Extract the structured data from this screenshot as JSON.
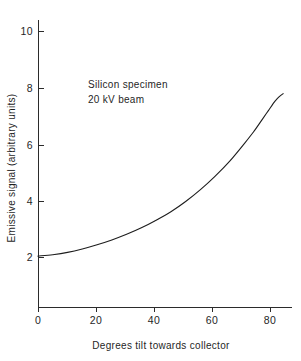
{
  "chart_data": {
    "type": "line",
    "title": "",
    "xlabel": "Degrees tilt towards collector",
    "ylabel": "Emissive signal (arbitrary units)",
    "xlim": [
      0,
      86
    ],
    "ylim": [
      0,
      10.6
    ],
    "xticks": [
      0,
      20,
      40,
      60,
      80
    ],
    "xtick_labels": [
      "0",
      "20",
      "40",
      "60",
      "80"
    ],
    "yticks": [
      2,
      4,
      6,
      8,
      10
    ],
    "ytick_labels": [
      "2",
      "4",
      "6",
      "8",
      "10"
    ],
    "grid": false,
    "legend": null,
    "annotations": [
      {
        "text": "Silicon specimen",
        "x": 18,
        "y": 8.3
      },
      {
        "text": "20 kV beam",
        "x": 18,
        "y": 7.8
      }
    ],
    "series": [
      {
        "name": "Emissive signal vs tilt",
        "color": "#1d1d1d",
        "x": [
          0,
          5,
          10,
          15,
          20,
          25,
          30,
          35,
          40,
          45,
          50,
          55,
          60,
          65,
          70,
          73,
          76,
          78,
          80,
          81,
          82,
          83
        ],
        "y": [
          2.05,
          2.1,
          2.18,
          2.3,
          2.45,
          2.62,
          2.82,
          3.05,
          3.32,
          3.62,
          3.98,
          4.4,
          4.88,
          5.42,
          6.05,
          6.45,
          6.9,
          7.2,
          7.5,
          7.62,
          7.72,
          7.8
        ]
      }
    ]
  },
  "geometry": {
    "plot_left": 38,
    "plot_right": 292,
    "plot_top": 20,
    "plot_bottom": 307,
    "x_axis_units_per_px": 0.3448,
    "y_axis_units_per_px": 0.0357
  },
  "axis": {
    "x_title": "Degrees tilt towards collector",
    "y_title": "Emissive signal (arbitrary units)"
  },
  "annotation": {
    "line1": "Silicon specimen",
    "line2": "20 kV beam"
  },
  "ticks": {
    "y": [
      "10",
      "8",
      "6",
      "4",
      "2"
    ],
    "x": [
      "0",
      "20",
      "40",
      "60",
      "80"
    ]
  },
  "colors": {
    "curve": "#1d1d1d",
    "axis": "#2b2b2b",
    "text": "#1f1f1f",
    "background": "#ffffff"
  }
}
